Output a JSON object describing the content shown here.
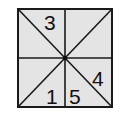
{
  "figure": {
    "colors": {
      "fill": "#e4e4e4",
      "stroke": "#1a1a1a",
      "background": "#ffffff"
    },
    "labels": [
      {
        "id": "region-top-left-upper",
        "text": "3"
      },
      {
        "id": "region-bottom-left-lower",
        "text": "1"
      },
      {
        "id": "region-bottom-right-lower",
        "text": "5"
      },
      {
        "id": "region-right-lower",
        "text": "4"
      }
    ]
  }
}
